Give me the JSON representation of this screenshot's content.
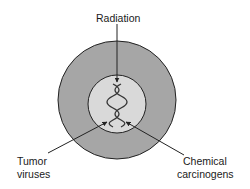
{
  "diagram": {
    "labels": {
      "top": "Radiation",
      "bottom_left_line1": "Tumor",
      "bottom_left_line2": "viruses",
      "bottom_right_line1": "Chemical",
      "bottom_right_line2": "carcinogens"
    },
    "parts": {
      "outer": "cytoplasm",
      "inner": "nucleus",
      "center": "DNA double helix"
    },
    "colors": {
      "outer_fill": "#a6a6a6",
      "inner_fill": "#d9d9d9",
      "stroke": "#222222"
    }
  }
}
